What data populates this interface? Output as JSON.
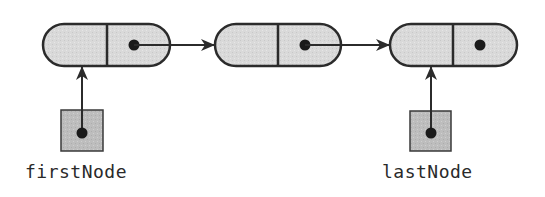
{
  "diagram": {
    "type": "singly-linked-list",
    "colors": {
      "stroke": "#2b2b2b",
      "node_fill": "#d9d9d9",
      "pointer_box_fill": "#bdbdbd",
      "background": "#ffffff"
    },
    "nodes": [
      {
        "id": "node-1",
        "data_field": "",
        "next": "node-2"
      },
      {
        "id": "node-2",
        "data_field": "",
        "next": "node-3"
      },
      {
        "id": "node-3",
        "data_field": "",
        "next": null
      }
    ],
    "pointers": [
      {
        "label": "firstNode",
        "points_to": "node-1"
      },
      {
        "label": "lastNode",
        "points_to": "node-3"
      }
    ]
  }
}
